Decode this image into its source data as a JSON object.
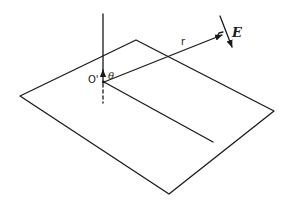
{
  "diagram": {
    "labels": {
      "origin": "O'",
      "angle": "θ",
      "radius": "r",
      "field": "E"
    },
    "colors": {
      "stroke": "#1a1a1a",
      "background": "#ffffff"
    }
  }
}
